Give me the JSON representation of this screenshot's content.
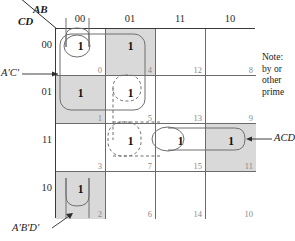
{
  "diagram": {
    "type": "karnaugh-map",
    "variables_top": "AB",
    "variables_side": "CD",
    "col_headers": [
      "00",
      "01",
      "11",
      "10"
    ],
    "row_headers": [
      "00",
      "01",
      "11",
      "10"
    ],
    "cells": [
      {
        "minterm": "0",
        "value": "1",
        "shaded": false
      },
      {
        "minterm": "4",
        "value": "1",
        "shaded": true
      },
      {
        "minterm": "12",
        "value": "",
        "shaded": false
      },
      {
        "minterm": "8",
        "value": "",
        "shaded": false
      },
      {
        "minterm": "1",
        "value": "1",
        "shaded": true
      },
      {
        "minterm": "5",
        "value": "1",
        "shaded": false
      },
      {
        "minterm": "13",
        "value": "",
        "shaded": false
      },
      {
        "minterm": "9",
        "value": "",
        "shaded": false
      },
      {
        "minterm": "3",
        "value": "",
        "shaded": false
      },
      {
        "minterm": "7",
        "value": "1",
        "shaded": false
      },
      {
        "minterm": "15",
        "value": "1",
        "shaded": false
      },
      {
        "minterm": "11",
        "value": "1",
        "shaded": true
      },
      {
        "minterm": "2",
        "value": "1",
        "shaded": true
      },
      {
        "minterm": "6",
        "value": "",
        "shaded": false
      },
      {
        "minterm": "14",
        "value": "",
        "shaded": false
      },
      {
        "minterm": "10",
        "value": "",
        "shaded": false
      }
    ],
    "terms": {
      "left": "A'C'",
      "right": "ACD",
      "bottom": "A'B'D'"
    },
    "note_lines": [
      "Note:",
      "by or",
      "other",
      "prime"
    ],
    "colors": {
      "shade": "#d9d9d9",
      "grid": "#6b6b6b",
      "border": "#3a3a3a",
      "group": "#6f6f6f",
      "text": "#1a1a1a",
      "minterm": "#8a8a8a"
    }
  }
}
